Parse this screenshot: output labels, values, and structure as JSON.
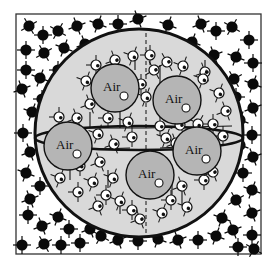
{
  "diagram": {
    "canvas": {
      "width": 277,
      "height": 262,
      "background": "#ffffff"
    },
    "frame": {
      "x": 16,
      "y": 14,
      "width": 245,
      "height": 240,
      "stroke": "#333333"
    },
    "colors": {
      "sphere_fill": "#d9d9d9",
      "bubble_fill": "#b5b5b5",
      "outline": "#111111",
      "dark_molecule": "#0a0a0a",
      "light_molecule": "#ffffff"
    },
    "sphere": {
      "cx": 139,
      "cy": 133,
      "r": 104
    },
    "equator": {
      "rx": 104,
      "ry": 12,
      "cy": 138
    },
    "meridian_dashed_x": 146,
    "air_bubbles": [
      {
        "label": "Air",
        "cx": 115,
        "cy": 88,
        "r": 24
      },
      {
        "label": "Air",
        "cx": 177,
        "cy": 100,
        "r": 24
      },
      {
        "label": "Air",
        "cx": 68,
        "cy": 146,
        "r": 24
      },
      {
        "label": "Air",
        "cx": 197,
        "cy": 151,
        "r": 24
      },
      {
        "label": "Air",
        "cx": 150,
        "cy": 175,
        "r": 24
      }
    ],
    "outer_molecules": [
      [
        29,
        26,
        -30
      ],
      [
        43,
        35,
        0
      ],
      [
        58,
        31,
        30
      ],
      [
        77,
        26,
        -20
      ],
      [
        98,
        24,
        20
      ],
      [
        118,
        24,
        0
      ],
      [
        138,
        19,
        -20
      ],
      [
        168,
        25,
        20
      ],
      [
        201,
        24,
        -20
      ],
      [
        216,
        31,
        0
      ],
      [
        232,
        27,
        30
      ],
      [
        249,
        40,
        0
      ],
      [
        26,
        50,
        0
      ],
      [
        44,
        53,
        -30
      ],
      [
        64,
        48,
        20
      ],
      [
        85,
        44,
        -20
      ],
      [
        192,
        42,
        20
      ],
      [
        214,
        55,
        -20
      ],
      [
        236,
        57,
        20
      ],
      [
        253,
        63,
        0
      ],
      [
        26,
        70,
        0
      ],
      [
        40,
        78,
        20
      ],
      [
        58,
        70,
        0
      ],
      [
        210,
        67,
        0
      ],
      [
        234,
        79,
        -30
      ],
      [
        253,
        84,
        20
      ],
      [
        22,
        89,
        -20
      ],
      [
        42,
        99,
        0
      ],
      [
        32,
        112,
        20
      ],
      [
        236,
        97,
        0
      ],
      [
        253,
        108,
        -20
      ],
      [
        240,
        120,
        20
      ],
      [
        23,
        133,
        0
      ],
      [
        30,
        152,
        -20
      ],
      [
        252,
        135,
        0
      ],
      [
        240,
        145,
        20
      ],
      [
        253,
        157,
        -20
      ],
      [
        26,
        173,
        20
      ],
      [
        40,
        186,
        0
      ],
      [
        30,
        199,
        -20
      ],
      [
        243,
        173,
        0
      ],
      [
        252,
        190,
        20
      ],
      [
        236,
        200,
        -30
      ],
      [
        28,
        215,
        0
      ],
      [
        42,
        226,
        -20
      ],
      [
        58,
        217,
        20
      ],
      [
        69,
        229,
        0
      ],
      [
        90,
        229,
        -20
      ],
      [
        80,
        243,
        0
      ],
      [
        101,
        236,
        30
      ],
      [
        118,
        240,
        -20
      ],
      [
        138,
        241,
        0
      ],
      [
        158,
        239,
        20
      ],
      [
        178,
        240,
        -20
      ],
      [
        198,
        240,
        0
      ],
      [
        216,
        236,
        20
      ],
      [
        233,
        230,
        -20
      ],
      [
        252,
        235,
        0
      ],
      [
        222,
        218,
        20
      ],
      [
        252,
        213,
        -20
      ],
      [
        22,
        245,
        0
      ],
      [
        44,
        244,
        -30
      ],
      [
        61,
        245,
        0
      ],
      [
        238,
        247,
        0
      ],
      [
        254,
        249,
        30
      ]
    ],
    "inner_molecules": [
      [
        115,
        60,
        -20
      ],
      [
        133,
        56,
        20
      ],
      [
        150,
        55,
        0
      ],
      [
        167,
        62,
        -30
      ],
      [
        183,
        66,
        20
      ],
      [
        205,
        72,
        -20
      ],
      [
        96,
        65,
        0
      ],
      [
        86,
        81,
        20
      ],
      [
        90,
        104,
        -20
      ],
      [
        141,
        84,
        0
      ],
      [
        146,
        97,
        20
      ],
      [
        154,
        70,
        -30
      ],
      [
        219,
        93,
        20
      ],
      [
        226,
        111,
        -20
      ],
      [
        213,
        124,
        0
      ],
      [
        203,
        79,
        20
      ],
      [
        59,
        117,
        0
      ],
      [
        77,
        118,
        -20
      ],
      [
        108,
        118,
        0
      ],
      [
        128,
        122,
        20
      ],
      [
        160,
        126,
        0
      ],
      [
        180,
        125,
        -20
      ],
      [
        198,
        124,
        30
      ],
      [
        98,
        134,
        20
      ],
      [
        114,
        144,
        -20
      ],
      [
        132,
        137,
        0
      ],
      [
        166,
        138,
        20
      ],
      [
        176,
        143,
        -20
      ],
      [
        223,
        136,
        0
      ],
      [
        60,
        178,
        20
      ],
      [
        80,
        166,
        0
      ],
      [
        100,
        162,
        -20
      ],
      [
        113,
        178,
        20
      ],
      [
        106,
        195,
        0
      ],
      [
        98,
        206,
        -20
      ],
      [
        120,
        201,
        20
      ],
      [
        132,
        210,
        0
      ],
      [
        140,
        219,
        -20
      ],
      [
        162,
        213,
        20
      ],
      [
        171,
        200,
        0
      ],
      [
        182,
        186,
        -20
      ],
      [
        187,
        207,
        20
      ],
      [
        204,
        180,
        0
      ],
      [
        213,
        172,
        -20
      ],
      [
        93,
        182,
        20
      ],
      [
        78,
        192,
        0
      ]
    ],
    "wire_lines": [
      [
        62,
        128,
        146,
        128
      ],
      [
        146,
        128,
        232,
        126
      ],
      [
        68,
        150,
        130,
        148
      ],
      [
        160,
        148,
        214,
        145
      ],
      [
        90,
        112,
        90,
        128
      ],
      [
        120,
        112,
        120,
        128
      ],
      [
        135,
        55,
        135,
        70
      ],
      [
        160,
        65,
        160,
        85
      ],
      [
        205,
        60,
        205,
        80
      ],
      [
        115,
        70,
        115,
        60
      ],
      [
        108,
        170,
        108,
        188
      ],
      [
        120,
        200,
        120,
        214
      ],
      [
        172,
        175,
        172,
        200
      ],
      [
        182,
        185,
        182,
        205
      ],
      [
        70,
        180,
        70,
        168
      ]
    ]
  }
}
